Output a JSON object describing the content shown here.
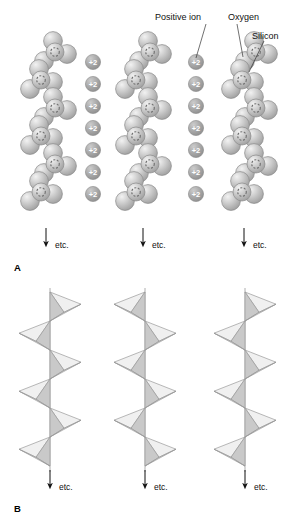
{
  "figure": {
    "background_color": "#ffffff",
    "width": 299,
    "height": 532
  },
  "annotations": {
    "positive_ion": {
      "label": "Positive ion",
      "x": 155,
      "y": 12,
      "leader_to_x": 196,
      "leader_to_y": 58
    },
    "oxygen": {
      "label": "Oxygen",
      "x": 228,
      "y": 12,
      "leader_to_x": 243,
      "leader_to_y": 57
    },
    "silicon": {
      "label": "Silicon",
      "x": 252,
      "y": 31,
      "leader_to_x": 249,
      "leader_to_y": 72
    }
  },
  "panels": [
    {
      "letter": "A",
      "letter_x": 14,
      "letter_y": 262,
      "style": "space-filling",
      "description": "Space-filling spheres of oxygen with silicon centers forming zigzag chains, separated by columns of divalent positive ions",
      "chains": [
        {
          "axis_x": 48,
          "start_side": "right"
        },
        {
          "axis_x": 143,
          "start_side": "right"
        },
        {
          "axis_x": 249,
          "start_side": "right"
        }
      ],
      "ion_columns": [
        {
          "x": 93,
          "charge": "+2",
          "count": 7
        },
        {
          "x": 196,
          "charge": "+2",
          "count": 7
        }
      ],
      "ion_start_y": 62,
      "ion_spacing": 22,
      "etc_arrows": [
        {
          "x": 46,
          "y": 228,
          "label": "etc."
        },
        {
          "x": 143,
          "y": 228,
          "label": "etc."
        },
        {
          "x": 244,
          "y": 228,
          "label": "etc."
        }
      ]
    },
    {
      "letter": "B",
      "letter_x": 14,
      "letter_y": 503,
      "style": "tetrahedra",
      "description": "The same chains drawn as linked SiO4 tetrahedra alternating left and right",
      "chains": [
        {
          "axis_x": 50,
          "start_side": "right"
        },
        {
          "axis_x": 145,
          "start_side": "left"
        },
        {
          "axis_x": 245,
          "start_side": "right"
        }
      ],
      "etc_arrows": [
        {
          "x": 50,
          "y": 470,
          "label": "etc."
        },
        {
          "x": 145,
          "y": 470,
          "label": "etc."
        },
        {
          "x": 245,
          "y": 470,
          "label": "etc."
        }
      ]
    }
  ],
  "colors": {
    "oxygen_sphere": "#b9b9b9",
    "oxygen_sphere_light": "#e2e2e2",
    "oxygen_outline": "#8a8a8a",
    "silicon_dash": "#6f6f6f",
    "ion_fill": "#a8a8a8",
    "ion_text": "#ffffff",
    "tetra_fill_light": "#f0f0f0",
    "tetra_fill_dark": "#c9c9c9",
    "tetra_stroke": "#9a9a9a",
    "axis_line": "#9a9a9a",
    "arrow": "#111111",
    "label_text": "#111111"
  }
}
